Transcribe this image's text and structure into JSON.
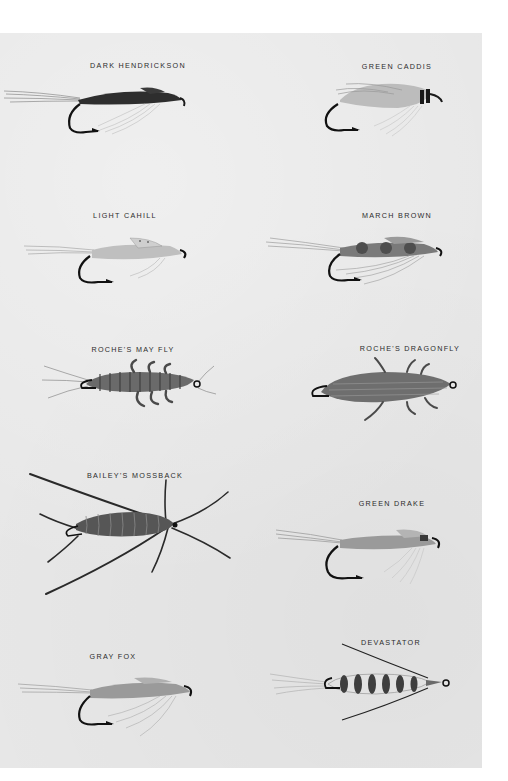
{
  "plate": {
    "background": "#e7e7e7",
    "flies": [
      {
        "name": "DARK HENDRICKSON",
        "column": "left",
        "row": 1
      },
      {
        "name": "GREEN CADDIS",
        "column": "right",
        "row": 1
      },
      {
        "name": "LIGHT CAHILL",
        "column": "left",
        "row": 2
      },
      {
        "name": "MARCH BROWN",
        "column": "right",
        "row": 2
      },
      {
        "name": "ROCHE'S MAY FLY",
        "column": "left",
        "row": 3
      },
      {
        "name": "ROCHE'S DRAGONFLY",
        "column": "right",
        "row": 3
      },
      {
        "name": "BAILEY'S MOSSBACK",
        "column": "left",
        "row": 4
      },
      {
        "name": "GREEN DRAKE",
        "column": "right",
        "row": 4
      },
      {
        "name": "GRAY FOX",
        "column": "left",
        "row": 5
      },
      {
        "name": "DEVASTATOR",
        "column": "right",
        "row": 5
      }
    ]
  }
}
